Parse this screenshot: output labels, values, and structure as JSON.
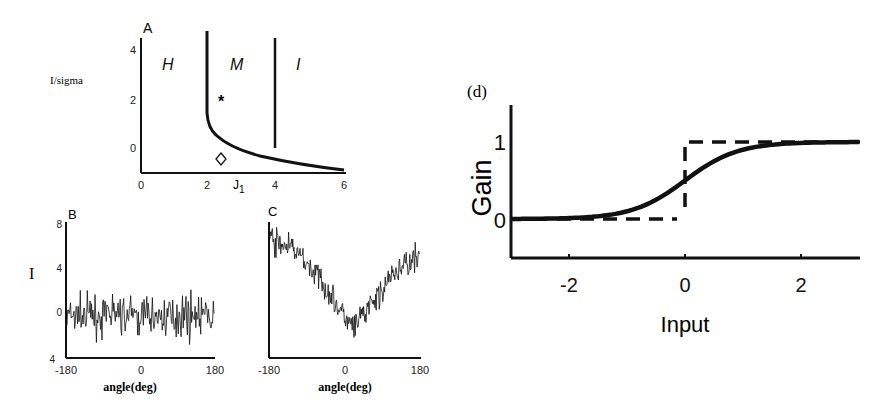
{
  "chart_data": [
    {
      "panel": "A",
      "type": "line",
      "title": "A",
      "xlabel": "J1",
      "ylabel": "I/sigma",
      "xlim": [
        0,
        6
      ],
      "ylim": [
        -0.8,
        4.5
      ],
      "xticks": [
        "0",
        "2",
        "4",
        "6"
      ],
      "yticks": [
        "0",
        "2",
        "4"
      ],
      "regions": [
        "H",
        "M",
        "I"
      ],
      "series": [
        {
          "name": "H-M boundary",
          "x": [
            2.0,
            2.0,
            2.05,
            2.2,
            2.5,
            3.0,
            3.5,
            4.0,
            4.5,
            5.0,
            5.5,
            6.0
          ],
          "y": [
            4.5,
            2.5,
            1.7,
            1.2,
            0.85,
            0.5,
            0.25,
            0.05,
            -0.1,
            -0.2,
            -0.3,
            -0.4
          ]
        },
        {
          "name": "M-I boundary",
          "x": [
            4.0,
            4.0
          ],
          "y": [
            4.5,
            0.05
          ]
        }
      ],
      "markers": [
        {
          "symbol": "*",
          "x": 2.4,
          "y": 1.9
        },
        {
          "symbol": "diamond",
          "x": 2.4,
          "y": -0.5
        }
      ]
    },
    {
      "panel": "B",
      "type": "line",
      "title": "B",
      "xlabel": "angle(deg)",
      "ylabel": "I",
      "xlim": [
        -180,
        180
      ],
      "ylim": [
        -4,
        8
      ],
      "xticks": [
        "-180",
        "0",
        "180"
      ],
      "yticks": [
        "8",
        "4",
        "0",
        "4"
      ],
      "description": "Noisy flat signal fluctuating around 0 (range approx -3 to 3)",
      "mean": 0,
      "noise_amplitude": 1.2
    },
    {
      "panel": "C",
      "type": "line",
      "title": "C",
      "xlabel": "angle(deg)",
      "ylabel": "",
      "xlim": [
        -180,
        180
      ],
      "ylim": [
        -4,
        8
      ],
      "xticks": [
        "-180",
        "0",
        "180"
      ],
      "description": "Noisy V-shaped tuning curve with minimum near 20 deg",
      "x": [
        -180,
        -120,
        -60,
        0,
        20,
        60,
        120,
        180
      ],
      "y": [
        6.5,
        5.5,
        3.0,
        -0.5,
        -1.5,
        0.5,
        3.5,
        5.5
      ]
    },
    {
      "panel": "d",
      "type": "line",
      "title": "(d)",
      "xlabel": "Input",
      "ylabel": "Gain",
      "xlim": [
        -3,
        3
      ],
      "ylim": [
        -0.5,
        1.4
      ],
      "xticks": [
        "-2",
        "0",
        "2"
      ],
      "yticks": [
        "0",
        "1"
      ],
      "series": [
        {
          "name": "sigmoid (solid)",
          "x": [
            -3,
            -2,
            -1.5,
            -1,
            -0.5,
            0,
            0.5,
            1,
            1.5,
            2,
            3
          ],
          "y": [
            0.0,
            0.02,
            0.05,
            0.12,
            0.27,
            0.5,
            0.73,
            0.88,
            0.95,
            0.98,
            1.0
          ]
        },
        {
          "name": "step (dashed)",
          "x": [
            -3,
            0,
            0,
            3
          ],
          "y": [
            0,
            0,
            1,
            1
          ]
        }
      ]
    }
  ],
  "labels": {
    "panelA": {
      "letter": "A",
      "ylabel": "I/sigma",
      "xlabel_main": "J",
      "xlabel_sub": "1",
      "regions": {
        "h": "H",
        "m": "M",
        "i": "I"
      },
      "xticks": [
        "0",
        "2",
        "4",
        "6"
      ],
      "yticks": [
        "4",
        "2",
        "0"
      ],
      "star": "*",
      "diamond": "◇"
    },
    "panelB": {
      "letter": "B",
      "ylabel": "I",
      "xlabel": "angle(deg)",
      "xticks": [
        "-180",
        "0",
        "180"
      ],
      "yticks": [
        "8",
        "4",
        "0",
        "4"
      ]
    },
    "panelC": {
      "letter": "C",
      "xlabel": "angle(deg)",
      "xticks": [
        "-180",
        "0",
        "180"
      ]
    },
    "panelD": {
      "letter": "(d)",
      "ylabel": "Gain",
      "xlabel": "Input",
      "xticks": [
        "-2",
        "0",
        "2"
      ],
      "yticks": [
        "1",
        "0"
      ]
    }
  },
  "colors": {
    "ink": "#111111",
    "background": "#ffffff"
  }
}
